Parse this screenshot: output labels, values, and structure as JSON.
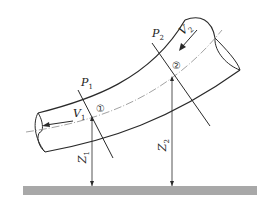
{
  "diagram": {
    "type": "bent pipe flow (Bernoulli)",
    "sections": [
      {
        "id": "section-1",
        "marker": "①",
        "pressure": "P",
        "pressure_sub": "1",
        "velocity": "V",
        "velocity_sub": "1",
        "elevation": "Z",
        "elevation_sub": "1"
      },
      {
        "id": "section-2",
        "marker": "②",
        "pressure": "P",
        "pressure_sub": "2",
        "velocity": "V",
        "velocity_sub": "2",
        "elevation": "Z",
        "elevation_sub": "2"
      }
    ],
    "reference": "datum ground",
    "colors": {
      "line": "#2a2a2a",
      "ground": "#a8a8a8",
      "centerline": "#8a8a8a"
    }
  }
}
